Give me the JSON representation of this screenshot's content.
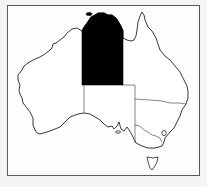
{
  "map": {
    "title": "Australia",
    "highlighted_region": "Northern Territory",
    "regions": [
      {
        "name": "Western Australia",
        "highlighted": false
      },
      {
        "name": "Northern Territory",
        "highlighted": true
      },
      {
        "name": "South Australia",
        "highlighted": false
      },
      {
        "name": "Queensland",
        "highlighted": false
      },
      {
        "name": "New South Wales",
        "highlighted": false
      },
      {
        "name": "Australian Capital Territory",
        "highlighted": false
      },
      {
        "name": "Victoria",
        "highlighted": false
      },
      {
        "name": "Tasmania",
        "highlighted": false
      }
    ],
    "colors": {
      "highlight": "#000000",
      "land": "#ffffff",
      "outline": "#222222",
      "frame": "#5a5a5a",
      "background": "#fdfdfd"
    }
  }
}
